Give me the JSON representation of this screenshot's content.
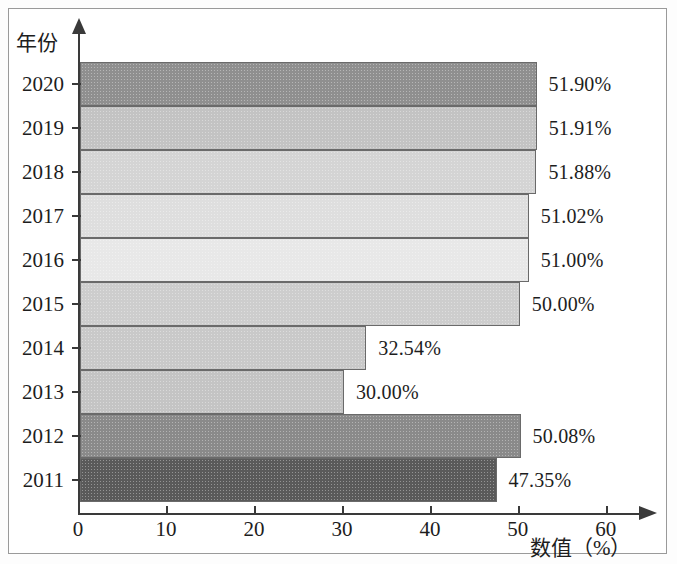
{
  "chart_data": {
    "type": "bar",
    "orientation": "horizontal",
    "title": "",
    "xlabel": "数值（%）",
    "ylabel": "年份",
    "categories": [
      "2020",
      "2019",
      "2018",
      "2017",
      "2016",
      "2015",
      "2014",
      "2013",
      "2012",
      "2011"
    ],
    "values": [
      51.9,
      51.91,
      51.88,
      51.02,
      51.0,
      50.0,
      32.54,
      30.0,
      50.08,
      47.35
    ],
    "value_labels": [
      "51.90%",
      "51.91%",
      "51.88%",
      "51.02%",
      "51.00%",
      "50.00%",
      "32.54%",
      "30.00%",
      "50.08%",
      "47.35%"
    ],
    "bar_colors": [
      "#8f8f8f",
      "#c3c3c3",
      "#d4d4d4",
      "#dedede",
      "#e8e8e8",
      "#cdcdcd",
      "#c9c9c9",
      "#c4c4c4",
      "#8a8a8a",
      "#5a5a5a"
    ],
    "xlim": [
      0,
      60
    ],
    "xticks": [
      0,
      10,
      20,
      30,
      40,
      50,
      60
    ],
    "xtick_labels": [
      "0",
      "10",
      "20",
      "30",
      "40",
      "50",
      "60"
    ],
    "grid": false,
    "legend": "none"
  },
  "axes": {
    "y_title": "年份",
    "x_title": "数值（%）"
  }
}
